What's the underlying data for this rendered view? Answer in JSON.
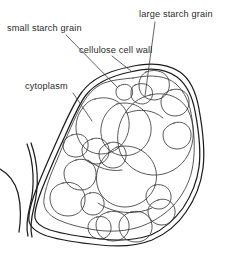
{
  "figure": {
    "background_color": "#ffffff",
    "stroke_color": "#1d1d1d",
    "text_color": "#2b2b2b"
  },
  "labels": {
    "small_starch_grain": "small starch grain",
    "cellulose_cell_wall": "cellulose cell wall",
    "large_starch_grain": "large starch grain",
    "cytoplasm": "cytoplasm"
  },
  "diagram_data": {
    "type": "labelled-line-diagram",
    "subject": "plant storage cell in cross-section",
    "parts": [
      {
        "name": "small starch grain",
        "label": "small starch grain",
        "label_position": [
          8,
          30
        ],
        "leader_from": [
          66,
          35
        ],
        "leader_to": [
          118,
          88
        ]
      },
      {
        "name": "cellulose cell wall",
        "label": "cellulose cell wall",
        "label_position": [
          79,
          52
        ],
        "leader_from": [
          112,
          56
        ],
        "leader_to": [
          130,
          70
        ]
      },
      {
        "name": "large starch grain",
        "label": "large starch grain",
        "label_position": [
          140,
          16
        ],
        "leader_from": [
          155,
          22
        ],
        "leader_to": [
          145,
          96
        ]
      },
      {
        "name": "cytoplasm",
        "label": "cytoplasm",
        "label_position": [
          26,
          88
        ],
        "leader_from": [
          73,
          93
        ],
        "leader_to": [
          92,
          121
        ]
      }
    ],
    "features": {
      "cell_wall_style": "double line (two parallel contours)",
      "neighbouring_wall": "partial double curve at lower left",
      "starch_grain_count": 22,
      "grain_shapes": "irregular rounded polygons and ovals, closely packed"
    }
  }
}
